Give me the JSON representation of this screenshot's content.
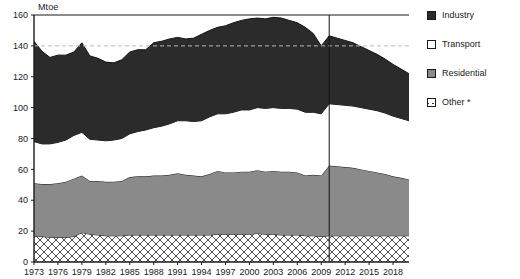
{
  "chart_data": {
    "type": "area",
    "stacked": true,
    "title": "",
    "subtitle": "",
    "xlabel": "",
    "ylabel": "Mtoe",
    "unit_label": "Mtoe",
    "ylim": [
      0,
      160
    ],
    "y_ticks": [
      0,
      20,
      40,
      60,
      80,
      100,
      120,
      140,
      160
    ],
    "xlim": [
      1973,
      2020
    ],
    "x_ticks": [
      1973,
      1976,
      1979,
      1982,
      1985,
      1988,
      1991,
      1994,
      1997,
      2000,
      2003,
      2006,
      2009,
      2012,
      2015,
      2018
    ],
    "grid": false,
    "reference_line_y": 140,
    "reference_line_style": "dashed",
    "projection_divider_x": 2010,
    "legend_position": "right",
    "x": [
      1973,
      1974,
      1975,
      1976,
      1977,
      1978,
      1979,
      1980,
      1981,
      1982,
      1983,
      1984,
      1985,
      1986,
      1987,
      1988,
      1989,
      1990,
      1991,
      1992,
      1993,
      1994,
      1995,
      1996,
      1997,
      1998,
      1999,
      2000,
      2001,
      2002,
      2003,
      2004,
      2005,
      2006,
      2007,
      2008,
      2009,
      2010,
      2011,
      2012,
      2013,
      2014,
      2015,
      2016,
      2017,
      2018,
      2019,
      2020
    ],
    "series": [
      {
        "name": "Other *",
        "color": "#ffffff",
        "pattern": "crosshatch",
        "values": [
          17,
          16.5,
          16,
          16,
          16,
          16.5,
          19,
          18,
          17.5,
          17,
          17,
          17,
          17.5,
          17.5,
          17.5,
          17.5,
          17.5,
          17.5,
          17.5,
          17.5,
          17.5,
          17.5,
          17.5,
          18,
          18,
          18,
          18,
          18,
          18.5,
          18,
          18,
          17.5,
          17.5,
          17.5,
          17,
          17,
          16.5,
          17,
          17,
          17,
          17,
          17,
          17,
          17,
          17,
          17,
          17,
          17
        ]
      },
      {
        "name": "Residential",
        "color": "#8a8a8a",
        "values": [
          34,
          34,
          34.5,
          35,
          36,
          37.5,
          37,
          34.5,
          35,
          35,
          35,
          35.5,
          37.5,
          38,
          38,
          38.5,
          38.5,
          39,
          40,
          39,
          38.5,
          38,
          39.5,
          41,
          40,
          40,
          40.5,
          40.5,
          41,
          40.5,
          41,
          41,
          41,
          40.5,
          39,
          39.5,
          39.5,
          45.5,
          45,
          44.5,
          44,
          43,
          42,
          41,
          40,
          38.5,
          37.5,
          36.5
        ]
      },
      {
        "name": "Transport",
        "color": "#ffffff",
        "values": [
          27,
          26,
          26,
          26.5,
          27,
          28,
          28,
          27,
          26.5,
          26.5,
          27,
          27.5,
          28,
          29,
          30,
          31,
          32,
          33,
          34,
          35,
          35,
          36,
          37,
          37,
          38,
          39,
          40,
          40,
          40.5,
          41,
          41,
          41,
          41,
          41,
          41,
          40.5,
          40,
          40,
          40,
          40,
          40,
          40,
          40,
          40,
          39.5,
          39,
          38.5,
          38
        ]
      },
      {
        "name": "Industry",
        "color": "#2b2b2b",
        "values": [
          65,
          60,
          56,
          56.5,
          55,
          54,
          58,
          54,
          53,
          51,
          50,
          51,
          53,
          53,
          52,
          55,
          55,
          55,
          54,
          53,
          54,
          56,
          56,
          56,
          57,
          58,
          58,
          59,
          58,
          58,
          58.5,
          58.5,
          57,
          56,
          55,
          51,
          44,
          44,
          43,
          42,
          41,
          39.5,
          38,
          36.5,
          35,
          33.5,
          32,
          30.5
        ]
      }
    ],
    "totals": [
      143,
      136.5,
      132.5,
      134,
      134,
      136,
      142,
      133.5,
      132,
      129.5,
      129,
      131,
      136,
      137.5,
      137.5,
      142,
      143,
      144.5,
      145.5,
      144.5,
      145,
      147.5,
      150,
      152,
      153,
      155,
      156.5,
      157.5,
      158,
      157.5,
      158.5,
      158,
      156.5,
      155,
      152,
      148,
      140,
      146.5,
      145,
      143.5,
      142,
      139.5,
      137,
      134,
      131.5,
      128,
      127,
      121
    ]
  },
  "legend": {
    "items": [
      {
        "label": "Industry",
        "swatch": "industry-swatch"
      },
      {
        "label": "Transport",
        "swatch": "transport-swatch"
      },
      {
        "label": "Residential",
        "swatch": "residential-swatch"
      },
      {
        "label": "Other *",
        "swatch": "other-swatch"
      }
    ]
  },
  "axis": {
    "y_tick_labels": [
      "160",
      "140",
      "120",
      "100",
      "80",
      "60",
      "40",
      "20",
      "0"
    ],
    "x_tick_labels": [
      "1973",
      "1976",
      "1979",
      "1982",
      "1985",
      "1988",
      "1991",
      "1994",
      "1997",
      "2000",
      "2003",
      "2006",
      "2009",
      "2012",
      "2015",
      "2018"
    ]
  },
  "colors": {
    "industry": "#2b2b2b",
    "transport": "#ffffff",
    "residential": "#8a8a8a",
    "other": "#ffffff",
    "axis": "#1a1a1a",
    "reference_line": "#bbbbbb"
  }
}
